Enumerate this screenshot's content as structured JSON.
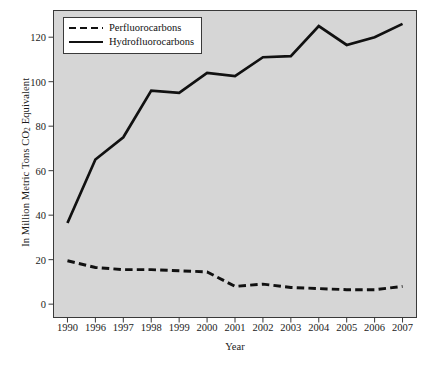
{
  "chart_data": {
    "type": "line",
    "title": "",
    "xlabel": "Year",
    "ylabel": "In Million Metric Tons CO2 Equivalent",
    "ylabel_prefix": "In Million Metric Tons CO",
    "ylabel_subscript": "2",
    "ylabel_suffix": " Equivalent",
    "categories": [
      "1990",
      "1996",
      "1997",
      "1998",
      "1999",
      "2000",
      "2001",
      "2002",
      "2003",
      "2004",
      "2005",
      "2006",
      "2007"
    ],
    "series": [
      {
        "name": "Perfluorocarbons",
        "style": "dashed",
        "color": "#111111",
        "values": [
          19.5,
          16.5,
          15.5,
          15.5,
          15.0,
          14.5,
          8.0,
          9.0,
          7.5,
          7.0,
          6.5,
          6.5,
          8.0
        ]
      },
      {
        "name": "Hydrofluorocarbons",
        "style": "solid",
        "color": "#111111",
        "values": [
          36.5,
          65.0,
          75.0,
          96.0,
          95.0,
          104.0,
          102.5,
          111.0,
          111.5,
          125.0,
          116.5,
          120.0,
          126.0
        ]
      }
    ],
    "ylim": [
      -6,
      132
    ],
    "yticks": [
      0,
      20,
      40,
      60,
      80,
      100,
      120
    ],
    "ytick_labels": [
      "0",
      "20",
      "40",
      "60",
      "80",
      "100",
      "120"
    ],
    "grid": false,
    "legend_position": "top-left",
    "plot_background": "#d6d6d6",
    "plot_border": "#3a3a3a",
    "page_background": "#ffffff"
  },
  "legend": {
    "entries": [
      {
        "label": "Perfluorocarbons",
        "style": "dashed"
      },
      {
        "label": "Hydrofluorocarbons",
        "style": "solid"
      }
    ]
  }
}
